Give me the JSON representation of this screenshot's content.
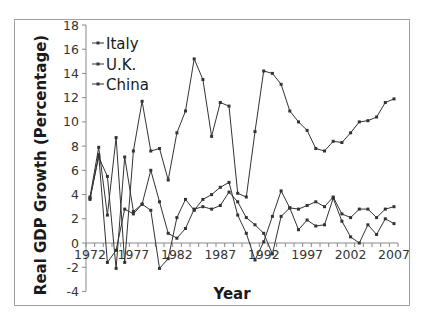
{
  "chart_data": {
    "type": "line",
    "title": "",
    "xlabel": "Year",
    "ylabel": "Real GDP Growth (Percentage)",
    "ylim": [
      -4,
      18
    ],
    "yticks": [
      -4,
      -2,
      0,
      2,
      4,
      6,
      8,
      10,
      12,
      14,
      16,
      18
    ],
    "xtick_labels": [
      "1972",
      "1977",
      "1982",
      "1987",
      "1992",
      "1997",
      "2002",
      "2007"
    ],
    "grid": false,
    "legend_position": "upper-left-inside",
    "x": [
      1972,
      1973,
      1974,
      1975,
      1976,
      1977,
      1978,
      1979,
      1980,
      1981,
      1982,
      1983,
      1984,
      1985,
      1986,
      1987,
      1988,
      1989,
      1990,
      1991,
      1992,
      1993,
      1994,
      1995,
      1996,
      1997,
      1998,
      1999,
      2000,
      2001,
      2002,
      2003,
      2004,
      2005,
      2006,
      2007
    ],
    "series": [
      {
        "name": "Italy",
        "values": [
          3.7,
          7.1,
          5.5,
          -2.1,
          7.1,
          2.6,
          3.2,
          6.0,
          3.4,
          0.8,
          0.4,
          1.2,
          2.8,
          3.0,
          2.8,
          3.1,
          4.2,
          3.4,
          2.1,
          1.5,
          0.8,
          -0.9,
          2.2,
          2.9,
          1.1,
          1.9,
          1.4,
          1.5,
          3.7,
          1.8,
          0.5,
          0.0,
          1.5,
          0.7,
          2.0,
          1.6
        ]
      },
      {
        "name": "U.K.",
        "values": [
          3.6,
          7.3,
          -1.6,
          -0.6,
          2.8,
          2.4,
          3.2,
          2.7,
          -2.1,
          -1.3,
          2.1,
          3.6,
          2.7,
          3.6,
          4.0,
          4.6,
          5.0,
          2.3,
          0.8,
          -1.4,
          0.1,
          2.2,
          4.3,
          2.9,
          2.8,
          3.1,
          3.4,
          3.0,
          3.8,
          2.4,
          2.1,
          2.8,
          2.8,
          2.1,
          2.8,
          3.0
        ]
      },
      {
        "name": "China",
        "values": [
          3.8,
          7.9,
          2.3,
          8.7,
          -1.6,
          7.6,
          11.7,
          7.6,
          7.8,
          5.2,
          9.1,
          10.9,
          15.2,
          13.5,
          8.8,
          11.6,
          11.3,
          4.1,
          3.8,
          9.2,
          14.2,
          14.0,
          13.1,
          10.9,
          10.0,
          9.3,
          7.8,
          7.6,
          8.4,
          8.3,
          9.1,
          10.0,
          10.1,
          10.4,
          11.6,
          11.9
        ]
      }
    ],
    "line_color": "#333333"
  },
  "legend": {
    "items": [
      "Italy",
      "U.K.",
      "China"
    ]
  },
  "axes": {
    "xlabel": "Year",
    "ylabel": "Real GDP Growth (Percentage)"
  }
}
